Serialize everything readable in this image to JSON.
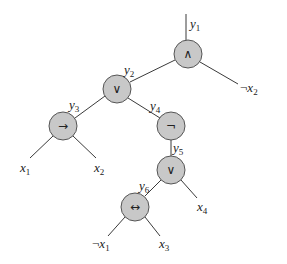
{
  "diagram": {
    "type": "boolean-circuit-tree",
    "nodes": [
      {
        "id": "n1",
        "op": "∧",
        "op_name": "and",
        "wire": "y",
        "wire_sub": "1",
        "x": 188,
        "y": 54
      },
      {
        "id": "n2",
        "op": "∨",
        "op_name": "or",
        "wire": "y",
        "wire_sub": "2",
        "x": 117,
        "y": 89
      },
      {
        "id": "n3",
        "op": "→",
        "op_name": "implies",
        "wire": "y",
        "wire_sub": "3",
        "x": 63,
        "y": 126
      },
      {
        "id": "n4",
        "op": "¬",
        "op_name": "not",
        "wire": "y",
        "wire_sub": "4",
        "x": 171,
        "y": 126
      },
      {
        "id": "n5",
        "op": "∨",
        "op_name": "or",
        "wire": "y",
        "wire_sub": "5",
        "x": 171,
        "y": 170
      },
      {
        "id": "n6",
        "op": "↔",
        "op_name": "iff",
        "wire": "y",
        "wire_sub": "6",
        "x": 135,
        "y": 207
      }
    ],
    "leaves": [
      {
        "id": "l_negx2",
        "prefix": "¬",
        "var": "x",
        "sub": "2",
        "x": 240,
        "y": 86
      },
      {
        "id": "l_x1",
        "prefix": "",
        "var": "x",
        "sub": "1",
        "x": 26,
        "y": 163
      },
      {
        "id": "l_x2",
        "prefix": "",
        "var": "x",
        "sub": "2",
        "x": 100,
        "y": 163
      },
      {
        "id": "l_x4",
        "prefix": "",
        "var": "x",
        "sub": "4",
        "x": 198,
        "y": 205
      },
      {
        "id": "l_negx1",
        "prefix": "¬",
        "var": "x",
        "sub": "1",
        "x": 98,
        "y": 244
      },
      {
        "id": "l_x3",
        "prefix": "",
        "var": "x",
        "sub": "3",
        "x": 160,
        "y": 244
      }
    ],
    "output_wire": {
      "var": "y",
      "sub": "1"
    },
    "colors": {
      "node_fill": "#c8c8c8",
      "node_stroke": "#555555",
      "edge": "#3a3a3a",
      "background": "#ffffff"
    }
  }
}
